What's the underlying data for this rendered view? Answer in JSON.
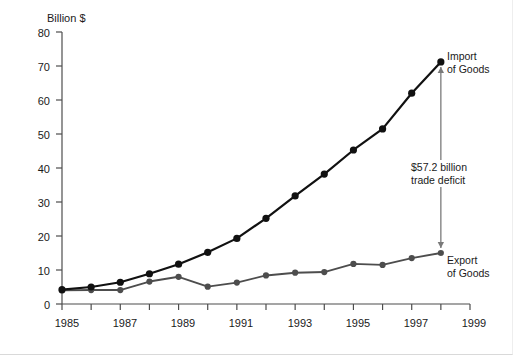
{
  "chart_data": {
    "type": "line",
    "title": "",
    "ylabel": "Billion $",
    "xlabel": "",
    "ylim": [
      0,
      80
    ],
    "xlim": [
      1985,
      1999
    ],
    "ytick_step": 10,
    "yticks": [
      0,
      10,
      20,
      30,
      40,
      50,
      60,
      70,
      80
    ],
    "xticks_major": [
      1985,
      1987,
      1989,
      1991,
      1993,
      1995,
      1997,
      1999
    ],
    "xticks_minor": [
      1986,
      1988,
      1990,
      1992,
      1994,
      1996,
      1998
    ],
    "grid": false,
    "legend_position": "inline-right-labels",
    "x": [
      1985,
      1986,
      1987,
      1988,
      1989,
      1990,
      1991,
      1992,
      1993,
      1994,
      1995,
      1996,
      1997,
      1998
    ],
    "series": [
      {
        "name": "Import of Goods",
        "label_line1": "Import",
        "label_line2": "of Goods",
        "color": "#111111",
        "marker": "circle",
        "values": [
          4.2,
          5.0,
          6.4,
          8.9,
          11.7,
          15.2,
          19.3,
          25.2,
          31.8,
          38.2,
          45.3,
          51.5,
          62.0,
          71.2
        ]
      },
      {
        "name": "Export of Goods",
        "label_line1": "Export",
        "label_line2": "of Goods",
        "color": "#4d4d4d",
        "marker": "circle",
        "values": [
          4.0,
          4.1,
          4.1,
          6.6,
          8.0,
          5.1,
          6.3,
          8.4,
          9.2,
          9.4,
          11.8,
          11.5,
          13.5,
          15.0
        ]
      }
    ],
    "annotations": [
      {
        "id": "trade-deficit",
        "line1": "$57.2 billion",
        "line2": "trade deficit",
        "value": 57.2,
        "at_x": 1998,
        "from_y": 15.0,
        "to_y": 71.2,
        "arrow": "double",
        "color": "#7a7a7a"
      }
    ]
  },
  "axis": {
    "y_title": "Billion $",
    "y_tick_labels": [
      "80",
      "70",
      "60",
      "50",
      "40",
      "30",
      "20",
      "10",
      "0"
    ],
    "x_tick_labels": [
      "1985",
      "1987",
      "1989",
      "1991",
      "1993",
      "1995",
      "1997",
      "1999"
    ]
  }
}
